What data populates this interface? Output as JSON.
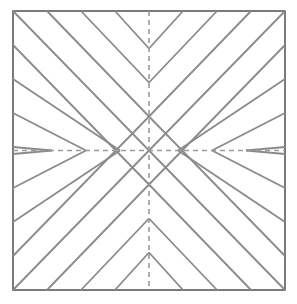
{
  "canvas": {
    "width": 297,
    "height": 304,
    "background_color": "#ffffff",
    "title": "Chevron Diagonal Pattern"
  },
  "figure": {
    "name": "chevron-pattern",
    "description": "Square frame containing a four-fold symmetric chevron pattern of 45 degree diagonal lines radiating from the center, with dashed horizontal and vertical center axes.",
    "symmetry": "4-fold mirror symmetry about horizontal and vertical center axes"
  },
  "frame": {
    "x": 13,
    "y": 11,
    "width": 272,
    "height": 279,
    "stroke_color": "#5a5a5a",
    "stroke_width": 1.6,
    "fill_color": "#ffffff"
  },
  "center": {
    "x": 149,
    "y": 150.5
  },
  "lines": {
    "diagonal_color": "#8a8a8a",
    "diagonal_width": 1.8,
    "axis_color": "#9a9a9a",
    "axis_width": 1.6,
    "axis_dash": "5 4",
    "spacing": 34,
    "angle_degrees": 45,
    "count_per_quadrant": 4
  },
  "chart_data": {
    "type": "line",
    "xlabel": "",
    "ylabel": "",
    "xlim": [
      13,
      285
    ],
    "ylim": [
      11,
      290
    ],
    "grid": false,
    "legend": "none",
    "series": [
      {
        "name": "top-left-descending-diagonals",
        "note": "45 degree lines running down-right in the upper-left quadrant, spaced 34 px",
        "values": [
          34,
          68,
          102,
          136
        ]
      },
      {
        "name": "top-right-ascending-diagonals",
        "note": "mirror of top-left lines across the vertical center axis",
        "values": [
          34,
          68,
          102,
          136
        ]
      },
      {
        "name": "bottom-left-ascending-diagonals",
        "note": "mirror of top-left lines across the horizontal center axis",
        "values": [
          34,
          68,
          102,
          136
        ]
      },
      {
        "name": "bottom-right-descending-diagonals",
        "note": "mirror of top-left lines across both center axes",
        "values": [
          34,
          68,
          102,
          136
        ]
      },
      {
        "name": "horizontal-center-axis",
        "note": "dashed line from left edge to right edge through the center",
        "values": [
          13,
          285
        ]
      },
      {
        "name": "vertical-center-axis",
        "note": "dashed line from top edge to bottom edge through the center",
        "values": [
          11,
          290
        ]
      }
    ]
  }
}
